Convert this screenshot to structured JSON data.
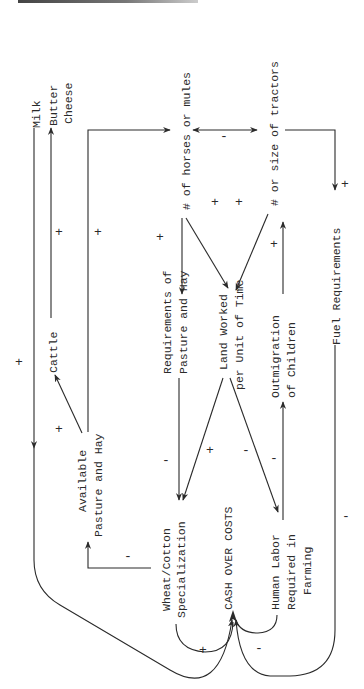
{
  "diagram": {
    "type": "causal-loop",
    "orientation": "rotated-90-ccw",
    "nodes": {
      "milk": "Milk",
      "butter": "Butter",
      "cheese": "Cheese",
      "cattle": "Cattle",
      "available_1": "Available",
      "available_2": "Pasture and Hay",
      "horses": "# of horses or mules",
      "tractors": "# or size of tractors",
      "requirements_1": "Requirements of",
      "requirements_2": "Pasture and Hay",
      "land_1": "Land Worked",
      "land_2": "per Unit of Time",
      "outmigration_1": "Outmigration",
      "outmigration_2": "of Children",
      "fuel": "Fuel Requirements",
      "wheat_1": "Wheat/Cotton",
      "wheat_2": "Specialization",
      "cash": "CASH OVER COSTS",
      "labor_1": "Human Labor",
      "labor_2": "Required in",
      "labor_3": "Farming"
    },
    "links": [
      {
        "from": "Cattle",
        "to": "Milk/Butter/Cheese",
        "sign": "+"
      },
      {
        "from": "Available Pasture and Hay",
        "to": "Cattle",
        "sign": "+"
      },
      {
        "from": "Available Pasture and Hay",
        "to": "# of horses or mules",
        "sign": "+"
      },
      {
        "from": "# of horses or mules",
        "to": "# or size of tractors",
        "sign": "-"
      },
      {
        "from": "# of horses or mules",
        "to": "Requirements of Pasture and Hay",
        "sign": "+"
      },
      {
        "from": "# of horses or mules",
        "to": "Land Worked per Unit of Time",
        "sign": "+"
      },
      {
        "from": "# or size of tractors",
        "to": "Land Worked per Unit of Time",
        "sign": "+"
      },
      {
        "from": "# or size of tractors",
        "to": "Fuel Requirements",
        "sign": "+"
      },
      {
        "from": "Outmigration of Children",
        "to": "# or size of tractors",
        "sign": "+"
      },
      {
        "from": "Requirements of Pasture and Hay",
        "to": "Wheat/Cotton Specialization",
        "sign": "-"
      },
      {
        "from": "Land Worked per Unit of Time",
        "to": "Wheat/Cotton Specialization",
        "sign": "+"
      },
      {
        "from": "Land Worked per Unit of Time",
        "to": "Human Labor Required in Farming",
        "sign": "-"
      },
      {
        "from": "Human Labor Required in Farming",
        "to": "Outmigration of Children",
        "sign": "-"
      },
      {
        "from": "Wheat/Cotton Specialization",
        "to": "Available Pasture and Hay",
        "sign": "-"
      },
      {
        "from": "Wheat/Cotton Specialization",
        "to": "CASH OVER COSTS",
        "sign": "+"
      },
      {
        "from": "Milk/Butter/Cheese",
        "to": "CASH OVER COSTS",
        "sign": "+"
      },
      {
        "from": "Human Labor Required in Farming",
        "to": "CASH OVER COSTS",
        "sign": "-"
      },
      {
        "from": "Fuel Requirements",
        "to": "CASH OVER COSTS",
        "sign": "-"
      }
    ],
    "signs": {
      "plus": "+",
      "minus": "-"
    }
  }
}
